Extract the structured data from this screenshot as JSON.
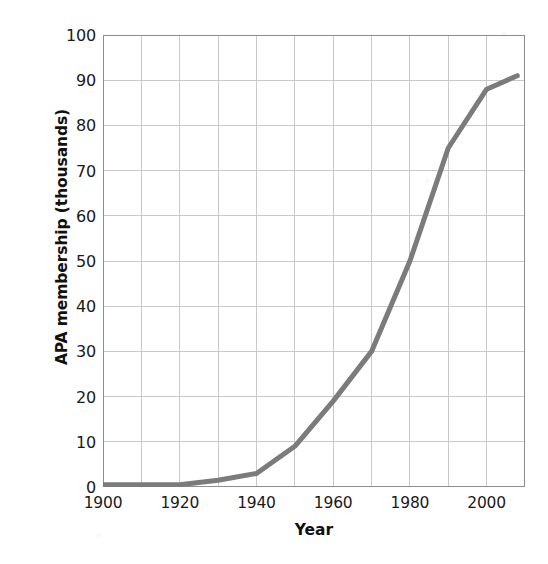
{
  "chart_data": {
    "type": "line",
    "title": "",
    "xlabel": "Year",
    "ylabel": "APA membership (thousands)",
    "xlim": [
      1900,
      2010
    ],
    "ylim": [
      0,
      100
    ],
    "grid": true,
    "legend": "none",
    "line_color": "#7b7b7b",
    "line_width": 5,
    "x_ticks": [
      1900,
      1920,
      1940,
      1960,
      1980,
      2000
    ],
    "x_tick_labels": [
      "1900",
      "1920",
      "1940",
      "1960",
      "1980",
      "2000"
    ],
    "x_minor_gridlines": [
      1910,
      1930,
      1950,
      1970,
      1990,
      2010
    ],
    "y_ticks": [
      0,
      10,
      20,
      30,
      40,
      50,
      60,
      70,
      80,
      90,
      100
    ],
    "y_tick_labels": [
      "0",
      "10",
      "20",
      "30",
      "40",
      "50",
      "60",
      "70",
      "80",
      "90",
      "100"
    ],
    "x": [
      1900,
      1920,
      1930,
      1940,
      1950,
      1960,
      1970,
      1980,
      1990,
      2000,
      2008
    ],
    "values": [
      0.5,
      0.5,
      1.5,
      3,
      9,
      19,
      30,
      50,
      75,
      88,
      91
    ],
    "series": [
      {
        "name": "APA membership",
        "x": [
          1900,
          1920,
          1930,
          1940,
          1950,
          1960,
          1970,
          1980,
          1990,
          2000,
          2008
        ],
        "values": [
          0.5,
          0.5,
          1.5,
          3,
          9,
          19,
          30,
          50,
          75,
          88,
          91
        ]
      }
    ],
    "annotations": []
  }
}
